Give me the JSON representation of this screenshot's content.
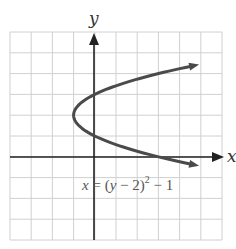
{
  "chart_data": {
    "type": "line",
    "title": "",
    "xlabel": "x",
    "ylabel": "y",
    "equation": "x = (y − 2)² − 1",
    "equation_parts": {
      "lhs": "x",
      "eq": " = (",
      "y": "y",
      "mid": " − 2)",
      "sup": "2",
      "tail": " − 1"
    },
    "xlim": [
      -4,
      6
    ],
    "ylim": [
      -4,
      6
    ],
    "grid": true,
    "grid_step": 1,
    "vertex": [
      -1,
      2
    ],
    "series": [
      {
        "name": "x = (y − 2)² − 1",
        "points": [
          [
            5.3,
            4.5
          ],
          [
            3,
            4
          ],
          [
            0,
            3
          ],
          [
            -1,
            2
          ],
          [
            0,
            1
          ],
          [
            3,
            0
          ],
          [
            5.3,
            -0.5
          ]
        ]
      }
    ],
    "colors": {
      "curve": "#4a4a4a",
      "grid": "#d0d0d0",
      "axis": "#222222"
    }
  }
}
